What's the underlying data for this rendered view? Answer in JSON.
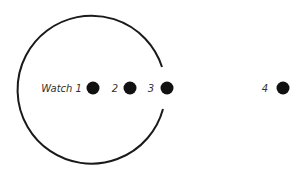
{
  "diagram": {
    "title": "",
    "circle": {
      "cx": 92,
      "cy": 89,
      "r": 74,
      "stroke": "#1a1a1a",
      "gap": "right side, around point 3"
    },
    "points": [
      {
        "label": "Watch 1",
        "x": 93,
        "y": 88
      },
      {
        "label": "2",
        "x": 130,
        "y": 88
      },
      {
        "label": "3",
        "x": 167,
        "y": 88
      },
      {
        "label": "4",
        "x": 283,
        "y": 88
      }
    ],
    "dot_color": "#111111"
  }
}
